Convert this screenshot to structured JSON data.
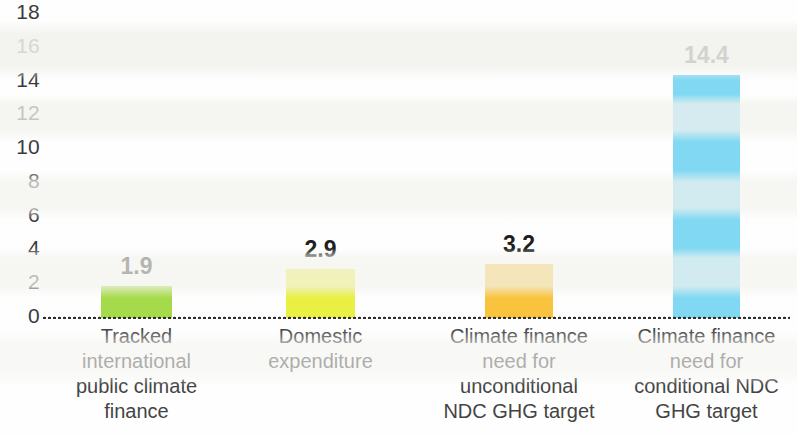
{
  "chart_data": {
    "type": "bar",
    "title": "",
    "subtitle": "",
    "xlabel": "",
    "ylabel": "",
    "ylim": [
      0,
      18
    ],
    "grid": false,
    "legend": null,
    "categories": [
      "Tracked international public climate finance",
      "Domestic expenditure",
      "Climate finance need for unconditional NDC GHG target",
      "Climate finance need for conditional NDC GHG target"
    ],
    "category_lines": [
      [
        "Tracked",
        "international",
        "public climate",
        "finance"
      ],
      [
        "Domestic",
        "expenditure"
      ],
      [
        "Climate finance",
        "need for",
        "unconditional",
        "NDC GHG target"
      ],
      [
        "Climate finance",
        "need for",
        "conditional NDC",
        "GHG target"
      ]
    ],
    "values": [
      1.9,
      2.9,
      3.2,
      14.4
    ],
    "value_labels": [
      "1.9",
      "2.9",
      "3.2",
      "14.4"
    ],
    "colors": [
      "#a5db4a",
      "#eaef43",
      "#f9c33d",
      "#80d8f3"
    ],
    "y_ticks": [
      18,
      16,
      14,
      12,
      10,
      8,
      6,
      4,
      2,
      0
    ],
    "y_tick_labels": [
      "18",
      "16",
      "14",
      "12",
      "10",
      "8",
      "6",
      "4",
      "2",
      "0"
    ]
  },
  "axis": {
    "baseline_style": "dotted"
  }
}
